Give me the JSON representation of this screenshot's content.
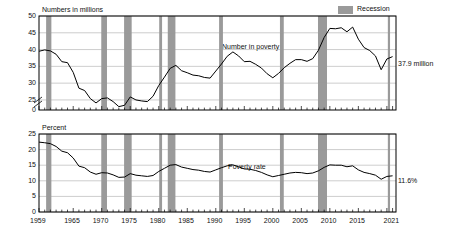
{
  "legend": {
    "label": "Recession",
    "swatch_color": "#9a9a9a"
  },
  "panels": [
    {
      "id": "number-in-poverty",
      "axis_title": "Numbers in millions",
      "series_label": "Number in poverty",
      "end_annotation": "37.9 million",
      "y_ticks": [
        "50",
        "45",
        "40",
        "35",
        "30",
        "25",
        "0"
      ]
    },
    {
      "id": "poverty-rate",
      "axis_title": "Percent",
      "series_label": "Poverty rate",
      "end_annotation": "11.6%",
      "y_ticks": [
        "25",
        "20",
        "15",
        "10",
        "5",
        "0"
      ]
    }
  ],
  "x_tick_labels": [
    "1959",
    "1965",
    "1970",
    "1975",
    "1980",
    "1985",
    "1990",
    "1995",
    "2000",
    "2005",
    "2010",
    "2015",
    "2021"
  ],
  "chart_data": {
    "type": "line",
    "xlabel": "Year",
    "grid": true,
    "legend_position": "top-right",
    "recessions": [
      [
        1960.25,
        1961.17
      ],
      [
        1969.92,
        1970.92
      ],
      [
        1973.92,
        1975.25
      ],
      [
        1980.08,
        1980.58
      ],
      [
        1981.58,
        1982.92
      ],
      [
        1990.58,
        1991.25
      ],
      [
        2001.25,
        2001.92
      ],
      [
        2007.92,
        2009.5
      ],
      [
        2020.17,
        2020.33
      ]
    ],
    "panels": [
      {
        "name": "Number in poverty",
        "ylabel": "Numbers in millions",
        "ylim": [
          22,
          50
        ],
        "yticks": [
          25,
          30,
          35,
          40,
          45,
          50
        ],
        "axis_break": true,
        "last_value": 37.9,
        "last_value_label": "37.9 million",
        "x": [
          1959,
          1960,
          1961,
          1962,
          1963,
          1964,
          1965,
          1966,
          1967,
          1968,
          1969,
          1970,
          1971,
          1972,
          1973,
          1974,
          1975,
          1976,
          1977,
          1978,
          1979,
          1980,
          1981,
          1982,
          1983,
          1984,
          1985,
          1986,
          1987,
          1988,
          1989,
          1990,
          1991,
          1992,
          1993,
          1994,
          1995,
          1996,
          1997,
          1998,
          1999,
          2000,
          2001,
          2002,
          2003,
          2004,
          2005,
          2006,
          2007,
          2008,
          2009,
          2010,
          2011,
          2012,
          2013,
          2014,
          2015,
          2016,
          2017,
          2018,
          2019,
          2020,
          2021
        ],
        "values": [
          39.5,
          39.9,
          39.6,
          38.6,
          36.4,
          36.1,
          33.2,
          28.5,
          27.8,
          25.4,
          24.1,
          25.4,
          25.6,
          24.5,
          23.0,
          23.4,
          25.9,
          25.0,
          24.7,
          24.5,
          26.1,
          29.3,
          31.8,
          34.4,
          35.3,
          33.7,
          33.1,
          32.4,
          32.2,
          31.7,
          31.5,
          33.6,
          35.7,
          38.0,
          39.3,
          38.1,
          36.4,
          36.5,
          35.6,
          34.5,
          32.8,
          31.6,
          32.9,
          34.6,
          35.9,
          37.0,
          37.0,
          36.5,
          37.3,
          39.8,
          43.6,
          46.3,
          46.2,
          46.5,
          45.3,
          46.7,
          43.1,
          40.6,
          39.7,
          38.1,
          34.0,
          37.2,
          37.9
        ]
      },
      {
        "name": "Poverty rate",
        "ylabel": "Percent",
        "ylim": [
          0,
          25
        ],
        "yticks": [
          0,
          5,
          10,
          15,
          20,
          25
        ],
        "axis_break": false,
        "last_value": 11.6,
        "last_value_label": "11.6%",
        "x": [
          1959,
          1960,
          1961,
          1962,
          1963,
          1964,
          1965,
          1966,
          1967,
          1968,
          1969,
          1970,
          1971,
          1972,
          1973,
          1974,
          1975,
          1976,
          1977,
          1978,
          1979,
          1980,
          1981,
          1982,
          1983,
          1984,
          1985,
          1986,
          1987,
          1988,
          1989,
          1990,
          1991,
          1992,
          1993,
          1994,
          1995,
          1996,
          1997,
          1998,
          1999,
          2000,
          2001,
          2002,
          2003,
          2004,
          2005,
          2006,
          2007,
          2008,
          2009,
          2010,
          2011,
          2012,
          2013,
          2014,
          2015,
          2016,
          2017,
          2018,
          2019,
          2020,
          2021
        ],
        "values": [
          22.4,
          22.2,
          21.9,
          21.0,
          19.5,
          19.0,
          17.3,
          14.7,
          14.2,
          12.8,
          12.1,
          12.6,
          12.5,
          11.9,
          11.1,
          11.2,
          12.3,
          11.8,
          11.6,
          11.4,
          11.7,
          13.0,
          14.0,
          15.0,
          15.2,
          14.4,
          14.0,
          13.6,
          13.4,
          13.0,
          12.8,
          13.5,
          14.2,
          14.8,
          15.1,
          14.5,
          13.8,
          13.7,
          13.3,
          12.7,
          11.9,
          11.3,
          11.7,
          12.1,
          12.5,
          12.7,
          12.6,
          12.3,
          12.5,
          13.2,
          14.3,
          15.1,
          15.0,
          15.0,
          14.5,
          14.8,
          13.5,
          12.7,
          12.3,
          11.8,
          10.5,
          11.4,
          11.6
        ]
      }
    ]
  }
}
